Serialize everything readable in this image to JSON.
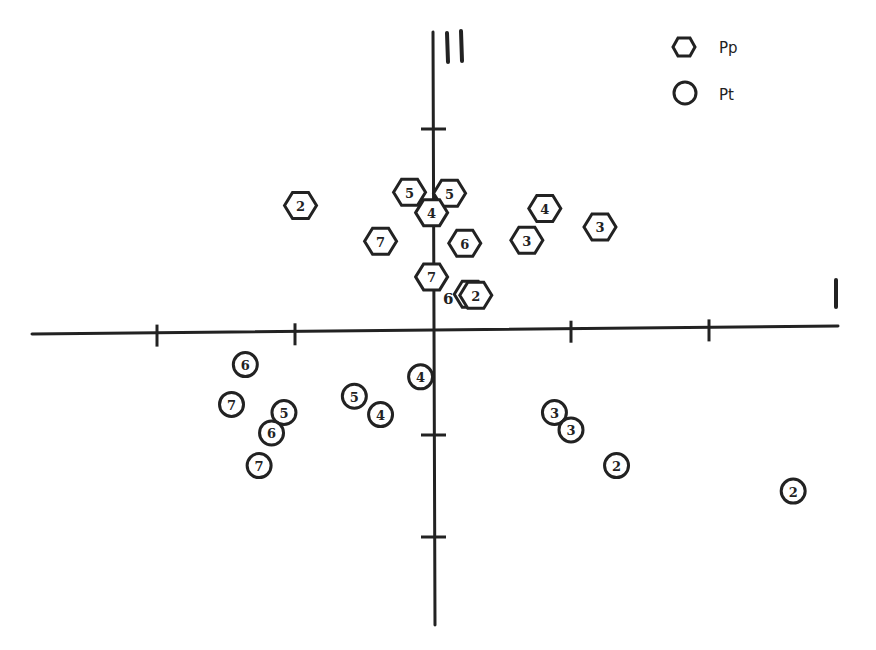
{
  "chart_data": {
    "type": "scatter",
    "title": "",
    "xlabel": "I",
    "ylabel": "III",
    "axis_origin_px": [
      433,
      333
    ],
    "unit_px": {
      "x": 138,
      "y": 102
    },
    "xlim": [
      -2.9,
      2.95
    ],
    "ylim": [
      -2.85,
      2.95
    ],
    "x_ticks": [
      -2,
      -1,
      0,
      1,
      2
    ],
    "y_ticks": [
      -2,
      -1,
      2
    ],
    "grid": false,
    "legend": {
      "position": "top-right",
      "entries": [
        {
          "marker": "hexagon",
          "label": "Pp"
        },
        {
          "marker": "circle",
          "label": "Pt"
        }
      ]
    },
    "series": [
      {
        "name": "Pp",
        "marker": "hexagon",
        "points": [
          {
            "label": "2",
            "x": -0.96,
            "y": 1.25
          },
          {
            "label": "5",
            "x": -0.17,
            "y": 1.38
          },
          {
            "label": "5",
            "x": 0.12,
            "y": 1.37
          },
          {
            "label": "4",
            "x": -0.01,
            "y": 1.18
          },
          {
            "label": "4",
            "x": 0.81,
            "y": 1.22
          },
          {
            "label": "3",
            "x": 1.21,
            "y": 1.04
          },
          {
            "label": "3",
            "x": 0.68,
            "y": 0.91
          },
          {
            "label": "7",
            "x": -0.38,
            "y": 0.9
          },
          {
            "label": "6",
            "x": 0.23,
            "y": 0.88
          },
          {
            "label": "7",
            "x": -0.01,
            "y": 0.55
          },
          {
            "label": "6",
            "x": 0.27,
            "y": 0.38
          },
          {
            "label": "2",
            "x": 0.31,
            "y": 0.37
          }
        ]
      },
      {
        "name": "Pt",
        "marker": "circle",
        "points": [
          {
            "label": "6",
            "x": -1.36,
            "y": -0.31
          },
          {
            "label": "7",
            "x": -1.46,
            "y": -0.7
          },
          {
            "label": "5",
            "x": -1.08,
            "y": -0.78
          },
          {
            "label": "6",
            "x": -1.17,
            "y": -0.98
          },
          {
            "label": "7",
            "x": -1.26,
            "y": -1.3
          },
          {
            "label": "5",
            "x": -0.57,
            "y": -0.62
          },
          {
            "label": "4",
            "x": -0.38,
            "y": -0.8
          },
          {
            "label": "4",
            "x": -0.09,
            "y": -0.43
          },
          {
            "label": "3",
            "x": 0.88,
            "y": -0.78
          },
          {
            "label": "3",
            "x": 1.0,
            "y": -0.95
          },
          {
            "label": "2",
            "x": 1.33,
            "y": -1.3
          },
          {
            "label": "2",
            "x": 2.61,
            "y": -1.55
          }
        ]
      }
    ],
    "annotations": [
      {
        "text": "6",
        "x": 0.11,
        "y": 0.33,
        "note": "label of partially hidden Pp hexagon 6 behind hexagon 2"
      }
    ]
  },
  "legend": {
    "pp_label": "Pp",
    "pt_label": "Pt"
  }
}
